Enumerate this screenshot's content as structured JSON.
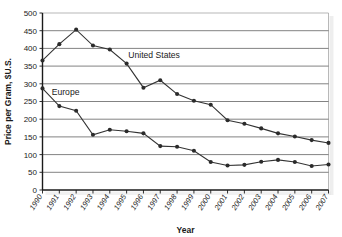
{
  "chart_data": {
    "type": "line",
    "title": "",
    "xlabel": "Year",
    "ylabel": "Price per Gram, $U.S.",
    "xlim": [
      1990,
      2007
    ],
    "ylim": [
      0,
      500
    ],
    "ytick_step": 50,
    "grid": true,
    "legend_position": "inline-annotations",
    "categories": [
      "1990",
      "1991",
      "1992",
      "1993",
      "1994",
      "1995",
      "1996",
      "1997",
      "1998",
      "1999",
      "2000",
      "2001",
      "2002",
      "2003",
      "2004",
      "2005",
      "2006",
      "2007"
    ],
    "yticks": [
      0,
      50,
      100,
      150,
      200,
      250,
      300,
      350,
      400,
      450,
      500
    ],
    "series": [
      {
        "name": "United States",
        "color": "#333333",
        "marker": "circle",
        "label_x": 1995.1,
        "label_y": 372,
        "values": [
          366,
          412,
          453,
          408,
          397,
          357,
          289,
          310,
          271,
          252,
          241,
          197,
          187,
          174,
          160,
          151,
          141,
          133
        ]
      },
      {
        "name": "Europe",
        "color": "#333333",
        "marker": "circle",
        "label_x": 1990.55,
        "label_y": 269,
        "values": [
          287,
          237,
          224,
          156,
          170,
          166,
          160,
          124,
          122,
          111,
          79,
          69,
          71,
          80,
          85,
          79,
          68,
          72
        ]
      }
    ]
  }
}
